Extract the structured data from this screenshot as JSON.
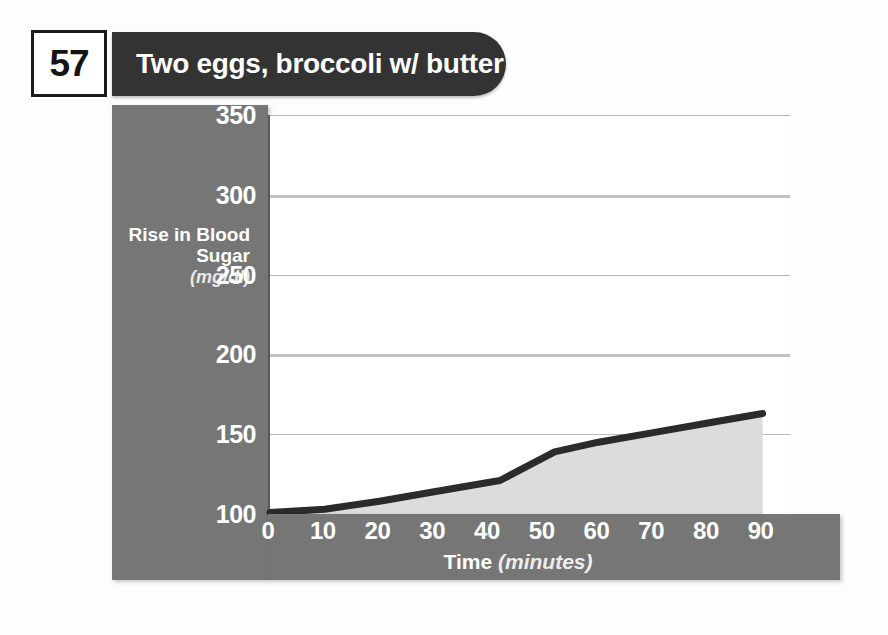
{
  "header": {
    "page_number": "57",
    "title": "Two eggs, broccoli w/ butter",
    "banner_color": "#333333",
    "page_box_border_color": "#1a1a1a"
  },
  "chart_data": {
    "type": "area",
    "title": "Two eggs, broccoli w/ butter",
    "xlabel": "Time",
    "xlabel_units": "(minutes)",
    "ylabel": "Rise in Blood Sugar",
    "ylabel_units": "(mg/dl)",
    "xlim": [
      0,
      95
    ],
    "ylim": [
      100,
      350
    ],
    "xticks": [
      "0",
      "10",
      "20",
      "30",
      "40",
      "50",
      "60",
      "70",
      "80",
      "90"
    ],
    "xtick_values": [
      0,
      10,
      20,
      30,
      40,
      50,
      60,
      70,
      80,
      90
    ],
    "yticks": [
      "100",
      "150",
      "200",
      "250",
      "300",
      "350"
    ],
    "ytick_values": [
      100,
      150,
      200,
      250,
      300,
      350
    ],
    "grid": true,
    "grid_axis": "y",
    "legend": "none",
    "x": [
      0,
      10,
      20,
      30,
      42,
      52,
      60,
      70,
      80,
      90
    ],
    "values": [
      101,
      103,
      108,
      114,
      121,
      139,
      145,
      151,
      157,
      163
    ],
    "end_label": "166",
    "end_label_value": 166,
    "line_color": "#2b2b2b",
    "fill_color": "#dcdcdc",
    "panel_color": "#767676",
    "grid_color": "#bcbcbc",
    "plot_background": "#ffffff"
  }
}
